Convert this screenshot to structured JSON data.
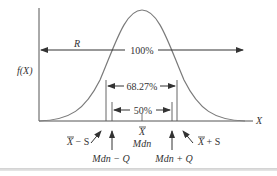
{
  "diagram": {
    "axes": {
      "y_label": "f(X)",
      "x_label": "X"
    },
    "range": {
      "label": "R",
      "percent": "100%"
    },
    "sd_interval": {
      "percent": "68.27%",
      "left_label_base": "X",
      "left_label_suffix": " − S",
      "right_label_base": "X",
      "right_label_suffix": " + S"
    },
    "quartile_interval": {
      "percent": "50%",
      "left_label": "Mdn − Q",
      "right_label": "Mdn + Q"
    },
    "center": {
      "mean_label": "X",
      "median_label": "Mdn"
    },
    "colors": {
      "curve": "#7a7a7a",
      "lines": "#333333",
      "text": "#333333"
    }
  }
}
